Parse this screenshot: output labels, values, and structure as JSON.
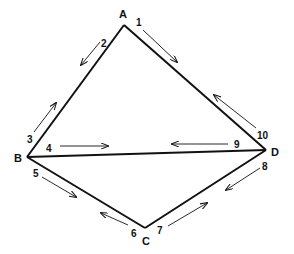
{
  "diagram": {
    "type": "quadrilateral-with-diagonal",
    "stroke_color": "#111111",
    "background": "#ffffff",
    "vertices": [
      {
        "id": "A",
        "label": "A",
        "x": 124,
        "y": 25,
        "lx": 123,
        "ly": 18
      },
      {
        "id": "B",
        "label": "B",
        "x": 27,
        "y": 157,
        "lx": 18,
        "ly": 162
      },
      {
        "id": "C",
        "label": "C",
        "x": 145,
        "y": 228,
        "lx": 146,
        "ly": 245
      },
      {
        "id": "D",
        "label": "D",
        "x": 266,
        "y": 150,
        "lx": 274,
        "ly": 156
      }
    ],
    "edges": [
      {
        "from": "A",
        "to": "B"
      },
      {
        "from": "A",
        "to": "D"
      },
      {
        "from": "B",
        "to": "D"
      },
      {
        "from": "B",
        "to": "C"
      },
      {
        "from": "C",
        "to": "D"
      }
    ],
    "directed_half_edges": [
      {
        "label": "1",
        "edge": "A-D",
        "direction": "A to D",
        "lx": 138,
        "ly": 26,
        "arrow": [
          143,
          30,
          177,
          62
        ]
      },
      {
        "label": "2",
        "edge": "A-B",
        "direction": "A to B",
        "lx": 104,
        "ly": 47,
        "arrow": [
          100,
          42,
          81,
          65
        ]
      },
      {
        "label": "3",
        "edge": "B-A",
        "direction": "B to A",
        "lx": 31,
        "ly": 143,
        "arrow": [
          34,
          132,
          56,
          103
        ]
      },
      {
        "label": "4",
        "edge": "B-D",
        "direction": "B to D",
        "lx": 49,
        "ly": 152,
        "arrow": [
          60,
          146,
          108,
          146
        ]
      },
      {
        "label": "5",
        "edge": "B-C",
        "direction": "B to C",
        "lx": 36,
        "ly": 177,
        "arrow": [
          42,
          177,
          76,
          197
        ]
      },
      {
        "label": "6",
        "edge": "C-B",
        "direction": "C to B",
        "lx": 134,
        "ly": 237,
        "arrow": [
          128,
          225,
          101,
          213
        ]
      },
      {
        "label": "7",
        "edge": "C-D",
        "direction": "C to D",
        "lx": 160,
        "ly": 234,
        "arrow": [
          168,
          226,
          207,
          203
        ]
      },
      {
        "label": "8",
        "edge": "D-C",
        "direction": "D to C",
        "lx": 262,
        "ly": 170,
        "arrow": [
          260,
          168,
          226,
          190
        ]
      },
      {
        "label": "9",
        "edge": "D-B",
        "direction": "D to B",
        "lx": 234,
        "ly": 148,
        "arrow": [
          228,
          144,
          172,
          144
        ]
      },
      {
        "label": "10",
        "edge": "D-A",
        "direction": "D to A",
        "lx": 259,
        "ly": 139,
        "arrow": [
          256,
          128,
          214,
          95
        ]
      }
    ]
  }
}
